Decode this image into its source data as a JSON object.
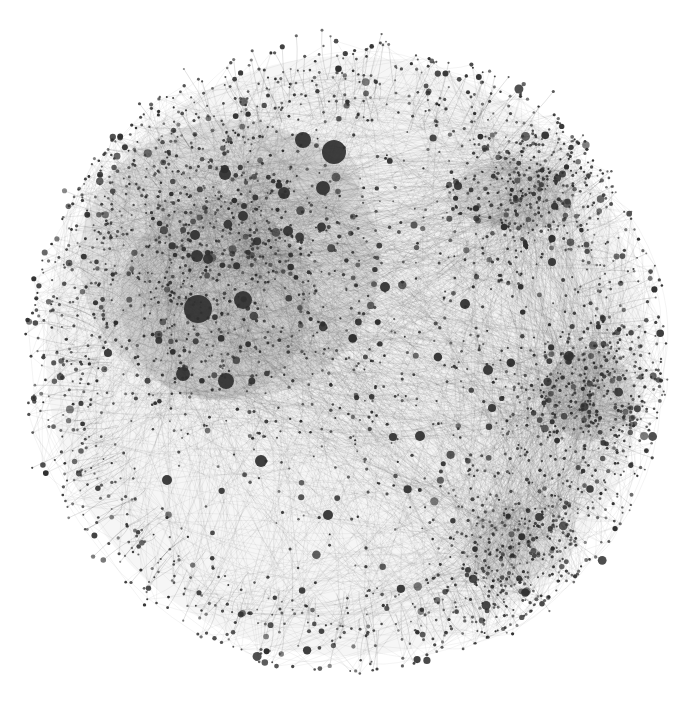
{
  "diagram": {
    "type": "force-directed-network",
    "labels_visible": false,
    "colors": {
      "background": "#ffffff",
      "node": "#2f2f2f",
      "edge": "#3a3a3a"
    },
    "clusters": [
      {
        "name": "upper-left-dense-core",
        "density": "very-high",
        "has_major_hubs": true
      },
      {
        "name": "upper-right-cluster",
        "density": "high",
        "has_major_hubs": false
      },
      {
        "name": "right-cluster",
        "density": "high",
        "has_major_hubs": false
      },
      {
        "name": "lower-right-cluster",
        "density": "medium",
        "has_major_hubs": false
      },
      {
        "name": "center-sparse-region",
        "density": "low",
        "has_major_hubs": false
      },
      {
        "name": "periphery-fringe",
        "density": "low",
        "has_major_hubs": false
      }
    ],
    "hub_count_large": 4,
    "hub_count_medium": 20,
    "node_count_approx": 3500
  }
}
